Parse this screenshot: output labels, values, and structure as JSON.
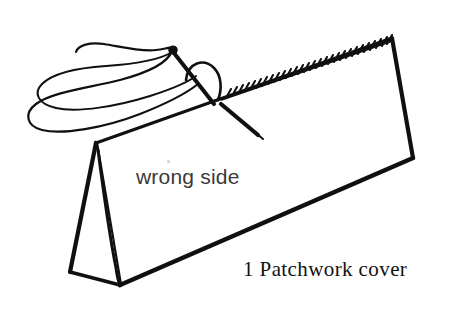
{
  "figure": {
    "background_color": "#ffffff",
    "ink_color": "#101010",
    "width": 469,
    "height": 314
  },
  "labels": {
    "fabric_side": "wrong side",
    "caption": "1 Patchwork cover"
  },
  "parts": {
    "fabric_panel_name": "folded fabric panel",
    "fold_flap_name": "folded back flap",
    "needle_name": "sewing needle",
    "thread_name": "thread loop",
    "stitch_line_name": "running stitch row"
  },
  "geometry": {
    "panel_corners": [
      [
        96,
        143
      ],
      [
        392,
        38
      ],
      [
        413,
        158
      ],
      [
        120,
        285
      ]
    ],
    "flap_corners": [
      [
        96,
        143
      ],
      [
        120,
        285
      ],
      [
        70,
        272
      ]
    ],
    "stitch_edge": {
      "from": [
        225,
        97
      ],
      "to": [
        390,
        40
      ],
      "count": 30,
      "tick_length": 9
    },
    "needle": {
      "eye": [
        172,
        50
      ],
      "tip": [
        262,
        138
      ]
    },
    "thread_loop_extent": {
      "left": 28,
      "right": 198,
      "top": 44,
      "bottom": 128
    }
  },
  "colors": {
    "ink": "#101010",
    "paper": "#ffffff",
    "label_text": "#3a3a3a",
    "caption_text": "#111111",
    "speck": "#cfcfcf"
  }
}
